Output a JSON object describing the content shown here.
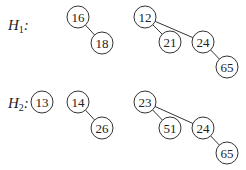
{
  "heaps": [
    {
      "label": "H",
      "subscript": "1",
      "colon": ":",
      "label_pos": [
        8,
        30
      ],
      "nodes": [
        {
          "id": "h1-16",
          "value": "16",
          "x": 78,
          "y": 17
        },
        {
          "id": "h1-18",
          "value": "18",
          "x": 102,
          "y": 43
        },
        {
          "id": "h1-12",
          "value": "12",
          "x": 145,
          "y": 17
        },
        {
          "id": "h1-21",
          "value": "21",
          "x": 170,
          "y": 42
        },
        {
          "id": "h1-24",
          "value": "24",
          "x": 203,
          "y": 42
        },
        {
          "id": "h1-65",
          "value": "65",
          "x": 227,
          "y": 67
        }
      ],
      "edges": [
        [
          "h1-16",
          "h1-18"
        ],
        [
          "h1-12",
          "h1-21"
        ],
        [
          "h1-12",
          "h1-24"
        ],
        [
          "h1-24",
          "h1-65"
        ]
      ]
    },
    {
      "label": "H",
      "subscript": "2",
      "colon": ":",
      "label_pos": [
        8,
        108
      ],
      "nodes": [
        {
          "id": "h2-13",
          "value": "13",
          "x": 42,
          "y": 102
        },
        {
          "id": "h2-14",
          "value": "14",
          "x": 78,
          "y": 102
        },
        {
          "id": "h2-26",
          "value": "26",
          "x": 102,
          "y": 128
        },
        {
          "id": "h2-23",
          "value": "23",
          "x": 145,
          "y": 102
        },
        {
          "id": "h2-51",
          "value": "51",
          "x": 170,
          "y": 128
        },
        {
          "id": "h2-24",
          "value": "24",
          "x": 203,
          "y": 128
        },
        {
          "id": "h2-65",
          "value": "65",
          "x": 227,
          "y": 153
        }
      ],
      "edges": [
        [
          "h2-14",
          "h2-26"
        ],
        [
          "h2-23",
          "h2-51"
        ],
        [
          "h2-23",
          "h2-24"
        ],
        [
          "h2-24",
          "h2-65"
        ]
      ]
    }
  ],
  "node_radius": 11
}
